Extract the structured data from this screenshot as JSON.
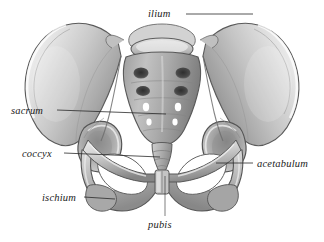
{
  "figure": {
    "background_color": "#ffffff",
    "width": 324,
    "height": 242,
    "style": "grayscale pencil/airbrush medical illustration, anterior view"
  },
  "labels": {
    "ilium": "ilium",
    "sacrum": "sacrum",
    "coccyx": "coccyx",
    "acetabulum": "acetabulum",
    "ischium": "ischium",
    "pubis": "pubis"
  },
  "colors": {
    "label_text": "#1b1b1b",
    "leader_line": "#2a2a2a",
    "bone_light": "#f2f2f2",
    "bone_mid": "#bdbdbd",
    "bone_shadow": "#8a8a8a",
    "bone_dark": "#5d5d5d",
    "foramen_dark": "#3a3a3a",
    "outline": "#4a4a4a"
  },
  "leader_lines": [
    {
      "name": "ilium-leader",
      "from": [
        186,
        14
      ],
      "to": [
        253,
        14
      ]
    },
    {
      "name": "sacrum-leader",
      "from": [
        57,
        110
      ],
      "to": [
        166,
        115
      ]
    },
    {
      "name": "coccyx-leader",
      "from": [
        64,
        153
      ],
      "to": [
        160,
        157
      ]
    },
    {
      "name": "acetabulum-leader",
      "from": [
        253,
        163
      ],
      "to": [
        216,
        163
      ]
    },
    {
      "name": "ischium-leader",
      "from": [
        84,
        197
      ],
      "to": [
        115,
        199
      ]
    },
    {
      "name": "pubis-leader",
      "from": [
        165,
        216
      ],
      "to": [
        165,
        176
      ]
    }
  ],
  "anatomy_parts": [
    "left-ilium-wing",
    "right-ilium-wing",
    "sacrum",
    "coccyx",
    "left-acetabulum",
    "right-acetabulum",
    "left-obturator-foramen",
    "right-obturator-foramen",
    "pubic-symphysis",
    "left-ischial-tuberosity",
    "right-ischial-tuberosity",
    "lumbar-vertebra"
  ]
}
